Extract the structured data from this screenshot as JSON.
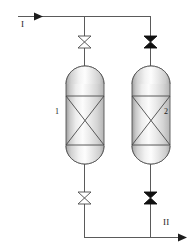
{
  "diagram": {
    "background_color": "#ffffff",
    "line_color": "#4d4d4d",
    "outline_color": "#555555",
    "valve_open_fill": "#ffffff",
    "valve_closed_fill": "#111111",
    "text_color": "#1a1a1a"
  },
  "streams": {
    "inlet": {
      "label": "I",
      "icon": "arrow-right-icon",
      "direction": "right"
    },
    "outlet": {
      "label": "II",
      "icon": "arrow-right-icon",
      "direction": "right"
    }
  },
  "vessels": [
    {
      "id": "vessel-1",
      "label": "1",
      "label_side": "left",
      "internals": "x-cross-packing"
    },
    {
      "id": "vessel-2",
      "label": "2",
      "label_side": "right",
      "internals": "x-cross-packing"
    }
  ],
  "valves": [
    {
      "id": "valve-top-left",
      "state": "open",
      "icon": "valve-bowtie-icon"
    },
    {
      "id": "valve-top-right",
      "state": "closed",
      "icon": "valve-bowtie-filled-icon"
    },
    {
      "id": "valve-bottom-left",
      "state": "open",
      "icon": "valve-bowtie-icon"
    },
    {
      "id": "valve-bottom-right",
      "state": "closed",
      "icon": "valve-bowtie-filled-icon"
    }
  ]
}
